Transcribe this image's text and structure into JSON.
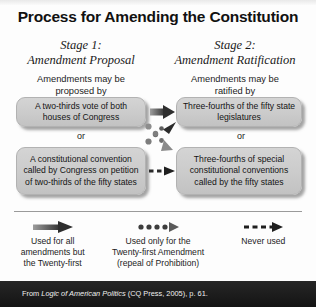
{
  "title": "Process for Amending the Constitution",
  "stages": [
    {
      "line1": "Stage 1:",
      "line2": "Amendment Proposal",
      "leadin_line1": "Amendments may be",
      "leadin_line2": "proposed by"
    },
    {
      "line1": "Stage 2:",
      "line2": "Amendment Ratification",
      "leadin_line1": "Amendments may be",
      "leadin_line2": "ratified by"
    }
  ],
  "boxes": {
    "proposal_a": "A two-thirds vote of both houses of Congress",
    "proposal_b": "A constitutional convention called by Congress on petition of two-thirds of the fifty states",
    "ratification_a": "Three-fourths of the fifty state legislatures",
    "ratification_b": "Three-fourths of special constitutional conventions called by the fifty states"
  },
  "connectors": {
    "or_left": "or",
    "or_right": "or"
  },
  "legend": [
    {
      "style": "solid-arrow",
      "caption_line1": "Used for all",
      "caption_line2": "amendments but",
      "caption_line3": "the Twenty-first"
    },
    {
      "style": "dotted-arrow",
      "caption_line1": "Used only for the",
      "caption_line2": "Twenty-first Amendment",
      "caption_line3": "(repeal of Prohibition)"
    },
    {
      "style": "dashed-arrow",
      "caption_line1": "Never used",
      "caption_line2": "",
      "caption_line3": ""
    }
  ],
  "footer": {
    "cite_prefix": "From ",
    "cite_italic": "Logic of American Politics",
    "cite_suffix": " (CQ Press, 2005), p. 61."
  },
  "colors": {
    "box_fill": "#cccccc",
    "box_border": "#b2b2b2",
    "arrow_dark": "#3a3a3a",
    "arrow_gray": "#8a8a8a",
    "footer_bg": "#1b1b1b",
    "text": "#141414"
  }
}
